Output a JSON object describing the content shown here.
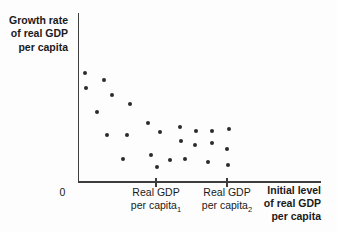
{
  "figure": {
    "y_axis_title": {
      "lines": [
        "Growth rate",
        "of real GDP",
        "per capita"
      ]
    },
    "x_axis_title": {
      "lines": [
        "Initial level",
        "of real GDP",
        "per capita"
      ]
    },
    "origin_label": "0",
    "x_tick_labels": [
      {
        "line1": "Real GDP",
        "line2": "per capita",
        "subscript": "1"
      },
      {
        "line1": "Real GDP",
        "line2": "per capita",
        "subscript": "2"
      }
    ]
  },
  "chart_data": {
    "type": "scatter",
    "title": "",
    "ylabel": "Growth rate of real GDP per capita",
    "xlabel": "Initial level of real GDP per capita",
    "x_tick_labels": [
      "Real GDP per capita 1",
      "Real GDP per capita 2"
    ],
    "axes_numeric": false,
    "legend": "none",
    "grid": false,
    "point_color": "#2b2b2b",
    "axis_color": "#3d3d3d",
    "text_color": "#1a1a1a",
    "point_radius_px": 2.2,
    "plot_px": {
      "origin_x": 78,
      "origin_y": 181,
      "x_end": 320,
      "y_top": 13
    },
    "x_ticks_px": [
      156,
      227
    ],
    "points_px": [
      [
        85,
        73
      ],
      [
        86,
        88
      ],
      [
        97,
        112
      ],
      [
        104,
        80
      ],
      [
        107,
        135
      ],
      [
        112,
        95
      ],
      [
        123,
        159
      ],
      [
        127,
        135
      ],
      [
        130,
        104
      ],
      [
        148,
        123
      ],
      [
        151,
        155
      ],
      [
        157,
        167
      ],
      [
        160,
        132
      ],
      [
        170,
        160
      ],
      [
        180,
        127
      ],
      [
        181,
        141
      ],
      [
        185,
        159
      ],
      [
        195,
        145
      ],
      [
        196,
        131
      ],
      [
        208,
        162
      ],
      [
        212,
        131
      ],
      [
        212,
        143
      ],
      [
        227,
        149
      ],
      [
        228,
        165
      ],
      [
        229,
        129
      ]
    ]
  }
}
